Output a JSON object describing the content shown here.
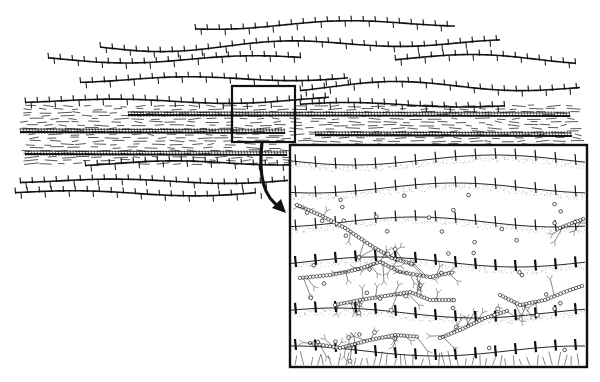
{
  "figure": {
    "type": "geological-biological illustration",
    "colors": {
      "ink": "#111111",
      "paper": "#ffffff",
      "stipple": "#999999"
    },
    "overview": {
      "strata": [
        {
          "id": "upper-layer-1",
          "y": 25,
          "x0": 195,
          "x1": 455,
          "wave": 6
        },
        {
          "id": "upper-layer-2",
          "y": 45,
          "x0": 100,
          "x1": 500,
          "wave": 8
        },
        {
          "id": "upper-layer-3",
          "y": 58,
          "x0": 48,
          "x1": 300,
          "wave": 6
        },
        {
          "id": "upper-layer-4",
          "y": 60,
          "x0": 395,
          "x1": 575,
          "wave": 7
        },
        {
          "id": "upper-layer-5",
          "y": 78,
          "x0": 80,
          "x1": 350,
          "wave": 6
        },
        {
          "id": "upper-layer-6",
          "y": 88,
          "x0": 300,
          "x1": 580,
          "wave": 8
        },
        {
          "id": "upper-layer-7",
          "y": 100,
          "x0": 25,
          "x1": 330,
          "wave": 5
        },
        {
          "id": "upper-layer-8",
          "y": 106,
          "x0": 300,
          "x1": 505,
          "wave": 5
        }
      ],
      "shale_band": {
        "y0": 105,
        "y1": 165,
        "x0": 20,
        "x1": 575
      },
      "mat_layers": [
        {
          "id": "mat-1",
          "y": 115,
          "x0": 128,
          "x1": 570
        },
        {
          "id": "mat-2",
          "y": 132,
          "x0": 20,
          "x1": 285
        },
        {
          "id": "mat-3",
          "y": 135,
          "x0": 315,
          "x1": 572
        },
        {
          "id": "mat-4",
          "y": 154,
          "x0": 25,
          "x1": 287
        }
      ],
      "lower_strata": [
        {
          "id": "lower-layer-1",
          "y": 162,
          "x0": 85,
          "x1": 290,
          "wave": 6
        },
        {
          "id": "lower-layer-2",
          "y": 180,
          "x0": 20,
          "x1": 290,
          "wave": 5
        },
        {
          "id": "lower-layer-3",
          "y": 192,
          "x0": 15,
          "x1": 255,
          "wave": 5
        }
      ]
    },
    "magnifier_box": {
      "x": 232,
      "y": 86,
      "w": 63,
      "h": 56
    },
    "arrow": {
      "from": [
        262,
        142
      ],
      "to": [
        286,
        213
      ]
    },
    "inset": {
      "x": 290,
      "y": 145,
      "w": 297,
      "h": 222,
      "layers": [
        {
          "y": 160,
          "stipple": true
        },
        {
          "y": 188,
          "stipple": true
        },
        {
          "y": 222,
          "stipple": true
        },
        {
          "y": 262,
          "stipple": true
        },
        {
          "y": 313,
          "stipple": true
        },
        {
          "y": 351,
          "stipple": false
        }
      ],
      "filaments": [
        {
          "pts": [
            [
              297,
              205
            ],
            [
              320,
              215
            ],
            [
              345,
              228
            ],
            [
              370,
              245
            ],
            [
              392,
              258
            ],
            [
              415,
              265
            ]
          ]
        },
        {
          "pts": [
            [
              300,
              278
            ],
            [
              330,
              275
            ],
            [
              355,
              270
            ],
            [
              380,
              262
            ],
            [
              400,
              272
            ],
            [
              430,
              277
            ],
            [
              455,
              272
            ]
          ]
        },
        {
          "pts": [
            [
              335,
              305
            ],
            [
              360,
              300
            ],
            [
              385,
              296
            ],
            [
              410,
              292
            ],
            [
              430,
              300
            ],
            [
              455,
              300
            ]
          ]
        },
        {
          "pts": [
            [
              500,
              295
            ],
            [
              520,
              305
            ],
            [
              545,
              300
            ],
            [
              570,
              290
            ],
            [
              585,
              285
            ]
          ]
        },
        {
          "pts": [
            [
              310,
              343
            ],
            [
              340,
              348
            ],
            [
              370,
              340
            ],
            [
              395,
              335
            ],
            [
              420,
              337
            ]
          ]
        },
        {
          "pts": [
            [
              440,
              338
            ],
            [
              460,
              330
            ],
            [
              485,
              318
            ],
            [
              510,
              310
            ]
          ]
        },
        {
          "pts": [
            [
              560,
              228
            ],
            [
              575,
              222
            ],
            [
              586,
              218
            ]
          ]
        }
      ]
    }
  }
}
